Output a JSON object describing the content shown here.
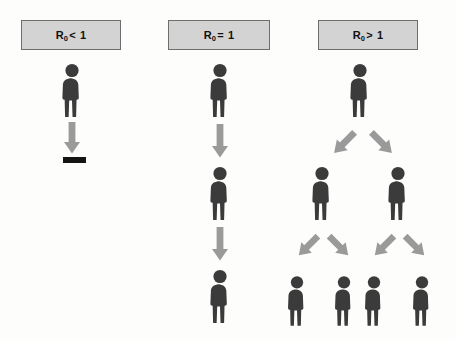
{
  "figure": {
    "title_r0_symbol": "R",
    "subscript": "0"
  },
  "panels": [
    {
      "id": "panel-less-than-one",
      "header": {
        "symbol": "R",
        "subscript": "0",
        "operator": "<",
        "value": "1",
        "full_label": "R0 < 1"
      },
      "generations": [
        1,
        0
      ],
      "outcome": "extinction",
      "people_count": 1,
      "arrow_count": 1,
      "has_end_bar": true
    },
    {
      "id": "panel-equal-to-one",
      "header": {
        "symbol": "R",
        "subscript": "0",
        "operator": "=",
        "value": "1",
        "full_label": "R0 = 1"
      },
      "generations": [
        1,
        1,
        1
      ],
      "outcome": "endemic",
      "people_count": 3,
      "arrow_count": 2,
      "has_end_bar": false
    },
    {
      "id": "panel-greater-than-one",
      "header": {
        "symbol": "R",
        "subscript": "0",
        "operator": ">",
        "value": "1",
        "full_label": "R0 > 1"
      },
      "generations": [
        1,
        2,
        4
      ],
      "outcome": "epidemic",
      "people_count": 7,
      "arrow_count": 6,
      "has_end_bar": false
    }
  ],
  "colors": {
    "person_fill": "#3b3b3b",
    "arrow_fill": "#9a9a9a",
    "header_box_fill": "#d3d3d3",
    "header_box_border": "#6e6e6e",
    "end_bar_fill": "#141414",
    "background": "#fdfdfc",
    "text": "#111111"
  },
  "icons": {
    "person": "person-icon",
    "arrow_down": "arrow-down-icon",
    "arrow_diagonal_left": "arrow-diagonal-down-left-icon",
    "arrow_diagonal_right": "arrow-diagonal-down-right-icon",
    "end_bar": "extinction-bar-icon"
  }
}
